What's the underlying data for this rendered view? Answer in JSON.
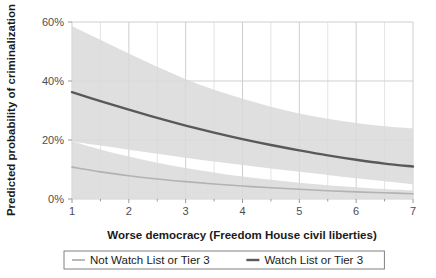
{
  "chart_data": {
    "type": "line",
    "title": "",
    "xlabel": "Worse democracy (Freedom House civil liberties)",
    "ylabel": "Predicted probability of criminalization",
    "xlim": [
      1,
      7
    ],
    "ylim": [
      0,
      60
    ],
    "xticks": [
      "1",
      "2",
      "3",
      "4",
      "5",
      "6",
      "7"
    ],
    "xtick_values": [
      1,
      2,
      3,
      4,
      5,
      6,
      7
    ],
    "yticks": [
      "0%",
      "20%",
      "40%",
      "60%"
    ],
    "ytick_values": [
      0,
      20,
      40,
      60
    ],
    "grid": true,
    "minor_grid_x": true,
    "legend_position": "bottom-center",
    "x": [
      1,
      1.5,
      2,
      2.5,
      3,
      3.5,
      4,
      4.5,
      5,
      5.5,
      6,
      6.5,
      7
    ],
    "series": [
      {
        "name": "Not Watch List or Tier 3",
        "color": "#b2b2b2",
        "linewidth": 1.6,
        "values": [
          10.8,
          9.2,
          7.9,
          6.8,
          5.9,
          5.1,
          4.4,
          3.8,
          3.3,
          2.8,
          2.4,
          2.1,
          1.8
        ],
        "band_upper": [
          19.6,
          16.8,
          14.4,
          12.3,
          10.5,
          9.0,
          7.6,
          6.5,
          5.5,
          4.7,
          4.0,
          3.4,
          2.9
        ],
        "band_lower": [
          0.0,
          0.0,
          0.0,
          0.0,
          0.0,
          0.0,
          0.0,
          0.0,
          0.0,
          0.0,
          0.0,
          0.0,
          0.0
        ],
        "band_fill": "#d9d9d9"
      },
      {
        "name": "Watch List or Tier 3",
        "color": "#595959",
        "linewidth": 2.4,
        "values": [
          36.2,
          33.2,
          30.3,
          27.5,
          24.9,
          22.5,
          20.3,
          18.3,
          16.5,
          14.8,
          13.3,
          12.0,
          11.0
        ],
        "band_upper": [
          58.6,
          54.0,
          49.3,
          44.8,
          40.6,
          37.0,
          34.0,
          31.3,
          29.0,
          27.2,
          25.8,
          24.7,
          24.0
        ],
        "band_lower": [
          19.5,
          18.1,
          16.7,
          15.3,
          14.0,
          12.7,
          11.5,
          10.3,
          9.2,
          8.1,
          7.0,
          6.0,
          5.0
        ],
        "band_fill": "#d9d9d9"
      }
    ],
    "legend_entries": [
      {
        "label": "Not Watch List or Tier 3",
        "color": "#b2b2b2"
      },
      {
        "label": "Watch List or Tier 3",
        "color": "#595959"
      }
    ]
  }
}
